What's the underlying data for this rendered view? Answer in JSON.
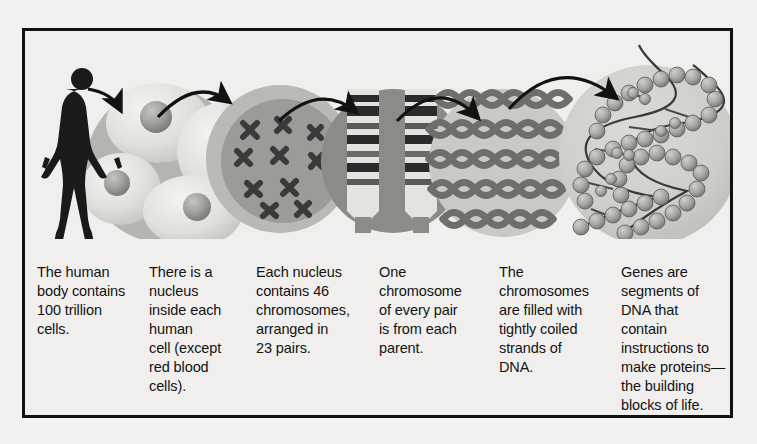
{
  "figure": {
    "border_color": "#111111",
    "background_color": "#f0efed",
    "page_background": "#f2f2f0"
  },
  "panels": [
    {
      "id": "human-body",
      "icon": "human-silhouette-icon",
      "caption": "The human\nbody contains\n100 trillion\ncells.",
      "fill": "#1a1a1a"
    },
    {
      "id": "cells",
      "icon": "cells-circle-icon",
      "caption": "There is a\nnucleus\ninside each\nhuman\ncell (except\nred blood\ncells).",
      "fill": "#dcdcd9",
      "backdrop": "#b4b4b1"
    },
    {
      "id": "nucleus-chromosomes",
      "icon": "nucleus-chromosomes-icon",
      "caption": "Each nucleus\ncontains 46\nchromosomes,\narranged in\n23 pairs.",
      "fill": "#9b9b98",
      "detail": "#3a3a3a"
    },
    {
      "id": "chromosome-pair",
      "icon": "banded-chromosome-icon",
      "caption": "One\nchromosome\nof every pair\nis from each\nparent.",
      "fill": "#8b8b88",
      "detail": "#2b2b2b"
    },
    {
      "id": "coiled-dna",
      "icon": "coiled-dna-strands-icon",
      "caption": "The\nchromosomes\nare filled with\ntightly coiled\nstrands of\nDNA.",
      "fill": "#c9c9c6",
      "detail": "#6e6e6b"
    },
    {
      "id": "dna-helix",
      "icon": "dna-double-helix-icon",
      "caption": "Genes are\nsegments of\nDNA that\ncontain\ninstructions to\nmake proteins—\nthe building\nblocks of life.",
      "fill": "#d2d2cf",
      "detail": "#8f8f8c"
    }
  ],
  "arrows": {
    "count": 5,
    "color": "#121212",
    "style": "curved-arrow-with-solid-head"
  }
}
